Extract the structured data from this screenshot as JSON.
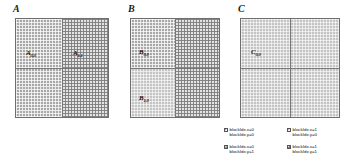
{
  "figure": {
    "caption": "",
    "panels": [
      {
        "id": "A",
        "letter": "A",
        "tiles": [
          {
            "name": "A0,0",
            "base": "A",
            "sub": "0,0",
            "shade": "dark"
          },
          {
            "name": "A1,1",
            "base": "A",
            "sub": "1,1",
            "shade": "light"
          }
        ]
      },
      {
        "id": "B",
        "letter": "B",
        "tiles": [
          {
            "name": "B0,0",
            "base": "B",
            "sub": "0,0",
            "shade": "dark"
          },
          {
            "name": "B1,0",
            "base": "B",
            "sub": "1,0",
            "shade": "mid"
          }
        ]
      },
      {
        "id": "C",
        "letter": "C",
        "tiles": [
          {
            "name": "C0,0",
            "base": "C",
            "sub": "0,0",
            "shade": "mid"
          }
        ]
      }
    ]
  },
  "legend": {
    "entries": [
      {
        "swatch": "s-dark",
        "line1": "blockIdx.x=0",
        "line2": "blockIdx.y=0"
      },
      {
        "swatch": "s-mid",
        "line1": "blockIdx.x=1",
        "line2": "blockIdx.y=0"
      },
      {
        "swatch": "s-midlight",
        "line1": "blockIdx.x=0",
        "line2": "blockIdx.y=1"
      },
      {
        "swatch": "s-light",
        "line1": "blockIdx.x=1",
        "line2": "blockIdx.y=1"
      }
    ]
  },
  "colors": {
    "background": "#ffffff",
    "grid_line": "#777777",
    "border": "#6e6e6e",
    "text": "#111111",
    "shade_dark": "#a8a8a8",
    "shade_mid": "#c4c4c4",
    "shade_midlight": "#d6d6d6",
    "shade_light": "#e3e3e3"
  }
}
